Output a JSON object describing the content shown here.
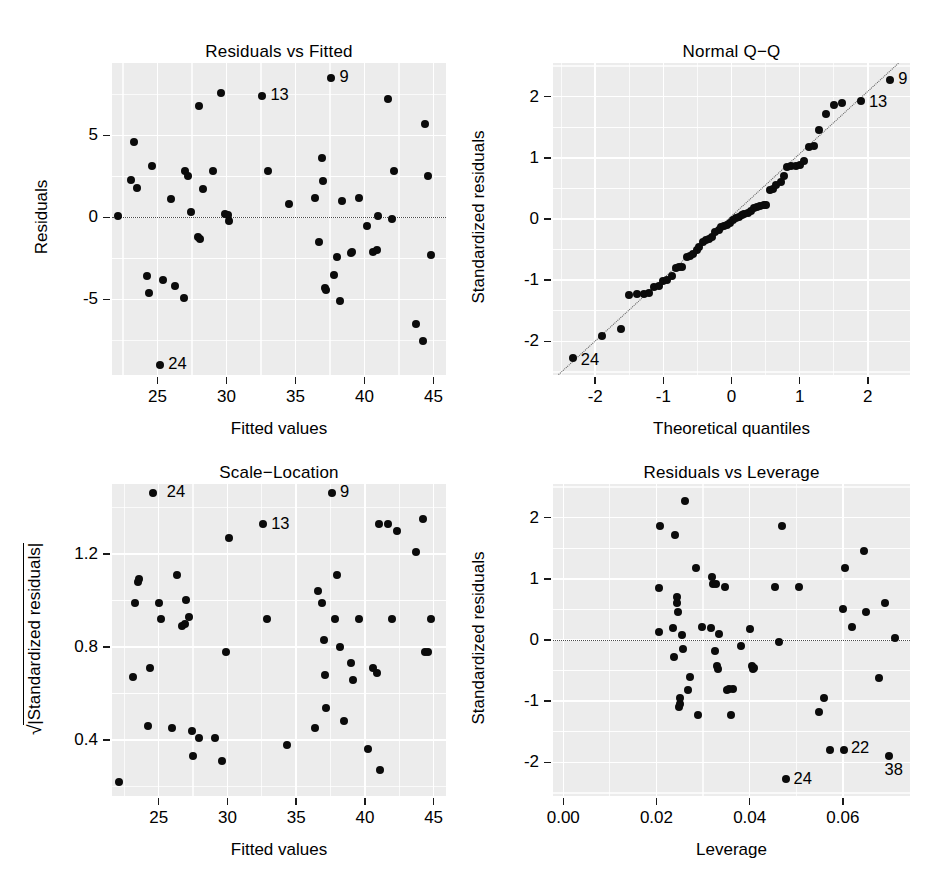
{
  "figure": {
    "kind": "r-regression-diagnostic-plots",
    "background": "#ffffff",
    "panel_background": "#ececec",
    "grid_color": "#ffffff",
    "point_color": "#0b0b0b"
  },
  "chart_data": [
    {
      "id": "residuals-vs-fitted",
      "type": "scatter",
      "title": "Residuals vs Fitted",
      "xlabel": "Fitted values",
      "ylabel": "Residuals",
      "xticks": [
        25,
        30,
        35,
        40,
        45
      ],
      "xticklabels": [
        "25",
        "30",
        "35",
        "40",
        "45"
      ],
      "yticks": [
        5,
        0,
        -5
      ],
      "yticklabels": [
        "5",
        "0",
        "-5"
      ],
      "xlim": [
        21.7,
        45.9
      ],
      "ylim": [
        -9.6,
        9.4
      ],
      "grid": true,
      "reference_line": {
        "type": "horizontal-dotted",
        "y": 0
      },
      "x": [
        22.1,
        23.1,
        23.3,
        23.5,
        24.2,
        24.4,
        24.6,
        25.2,
        25.4,
        26.0,
        26.3,
        26.9,
        27.0,
        27.2,
        27.4,
        27.9,
        28.0,
        28.1,
        28.3,
        29.0,
        29.6,
        29.9,
        30.1,
        30.2,
        32.6,
        33.0,
        34.5,
        36.4,
        36.7,
        36.9,
        37.0,
        37.1,
        37.2,
        37.6,
        37.8,
        38.0,
        38.2,
        38.4,
        39.0,
        39.1,
        39.6,
        40.2,
        40.6,
        40.9,
        41.0,
        41.7,
        42.0,
        42.1,
        43.7,
        44.2,
        44.4,
        44.6,
        44.8
      ],
      "y": [
        0.1,
        2.3,
        4.6,
        1.8,
        -3.6,
        -4.6,
        3.1,
        -9.0,
        -3.8,
        1.1,
        -4.2,
        -4.9,
        2.8,
        2.5,
        0.3,
        -1.2,
        6.8,
        -1.3,
        1.7,
        2.8,
        7.6,
        0.2,
        0.15,
        -0.2,
        7.4,
        2.8,
        0.8,
        1.2,
        -1.5,
        3.6,
        2.2,
        -4.3,
        -4.4,
        8.5,
        -3.5,
        -2.4,
        -5.1,
        1.0,
        -2.2,
        -2.1,
        1.2,
        -0.5,
        -2.1,
        -2.0,
        0.1,
        7.2,
        -0.1,
        2.8,
        -6.5,
        -7.5,
        5.7,
        2.5,
        -2.3
      ],
      "labeled_points": [
        {
          "label": "9",
          "x": 37.6,
          "y": 8.5,
          "dx": 8,
          "dy": -1
        },
        {
          "label": "13",
          "x": 32.6,
          "y": 7.4,
          "dx": 8,
          "dy": -1
        },
        {
          "label": "24",
          "x": 25.2,
          "y": -9.0,
          "dx": 8,
          "dy": -1
        }
      ]
    },
    {
      "id": "normal-qq",
      "type": "scatter",
      "title": "Normal Q−Q",
      "xlabel": "Theoretical quantiles",
      "ylabel": "Standardized residuals",
      "xticks": [
        -2,
        -1,
        0,
        1,
        2
      ],
      "xticklabels": [
        "-2",
        "-1",
        "0",
        "1",
        "2"
      ],
      "yticks": [
        2,
        1,
        0,
        -1,
        -2
      ],
      "yticklabels": [
        "2",
        "1",
        "0",
        "-1",
        "-2"
      ],
      "xlim": [
        -2.62,
        2.62
      ],
      "ylim": [
        -2.55,
        2.55
      ],
      "grid": true,
      "reference_line": {
        "type": "qq-diagonal-dotted",
        "slope": 1.02,
        "intercept": 0.06
      },
      "x": [
        -2.33,
        -1.9,
        -1.62,
        -1.5,
        -1.38,
        -1.29,
        -1.21,
        -1.14,
        -1.07,
        -1.0,
        -0.94,
        -0.88,
        -0.82,
        -0.77,
        -0.72,
        -0.66,
        -0.61,
        -0.56,
        -0.51,
        -0.47,
        -0.42,
        -0.37,
        -0.33,
        -0.28,
        -0.24,
        -0.19,
        -0.15,
        -0.11,
        -0.06,
        -0.02,
        0.02,
        0.06,
        0.11,
        0.15,
        0.19,
        0.24,
        0.28,
        0.33,
        0.37,
        0.42,
        0.47,
        0.51,
        0.56,
        0.61,
        0.66,
        0.72,
        0.77,
        0.82,
        0.88,
        0.94,
        1.0,
        1.07,
        1.14,
        1.21,
        1.29,
        1.38,
        1.5,
        1.62,
        1.9,
        2.33
      ],
      "y": [
        -2.28,
        -1.92,
        -1.8,
        -1.25,
        -1.22,
        -1.22,
        -1.21,
        -1.11,
        -1.09,
        -1.02,
        -1.0,
        -0.93,
        -0.8,
        -0.79,
        -0.79,
        -0.62,
        -0.6,
        -0.57,
        -0.5,
        -0.46,
        -0.38,
        -0.34,
        -0.33,
        -0.29,
        -0.21,
        -0.18,
        -0.13,
        -0.12,
        -0.1,
        -0.06,
        -0.02,
        0.01,
        0.03,
        0.06,
        0.08,
        0.1,
        0.13,
        0.18,
        0.2,
        0.22,
        0.23,
        0.23,
        0.47,
        0.49,
        0.55,
        0.6,
        0.7,
        0.85,
        0.86,
        0.86,
        0.88,
        0.95,
        1.18,
        1.2,
        1.45,
        1.72,
        1.87,
        1.9,
        1.93,
        2.28
      ],
      "labeled_points": [
        {
          "label": "9",
          "x": 2.33,
          "y": 2.28,
          "dx": 8,
          "dy": -1
        },
        {
          "label": "13",
          "x": 1.9,
          "y": 1.93,
          "dx": 8,
          "dy": 1
        },
        {
          "label": "24",
          "x": -2.33,
          "y": -2.28,
          "dx": 8,
          "dy": 2
        }
      ]
    },
    {
      "id": "scale-location",
      "type": "scatter",
      "title": "Scale−Location",
      "xlabel": "Fitted values",
      "ylabel": "√|Standardized residuals|",
      "xticks": [
        25,
        30,
        35,
        40,
        45
      ],
      "xticklabels": [
        "25",
        "30",
        "35",
        "40",
        "45"
      ],
      "yticks": [
        1.2,
        0.8,
        0.4
      ],
      "yticklabels": [
        "1.2",
        "0.8",
        "0.4"
      ],
      "xlim": [
        21.6,
        45.9
      ],
      "ylim": [
        0.16,
        1.5
      ],
      "grid": true,
      "x": [
        22.1,
        23.1,
        23.3,
        23.5,
        23.6,
        24.2,
        24.4,
        24.6,
        25.0,
        25.2,
        26.0,
        26.3,
        26.7,
        26.9,
        27.0,
        27.2,
        27.4,
        27.5,
        27.9,
        29.1,
        29.6,
        29.9,
        30.1,
        32.6,
        32.9,
        34.3,
        36.4,
        36.6,
        36.9,
        37.0,
        37.1,
        37.2,
        37.6,
        37.8,
        38.0,
        38.2,
        38.5,
        39.0,
        39.1,
        39.6,
        40.2,
        40.6,
        40.9,
        41.0,
        41.1,
        41.7,
        42.0,
        42.3,
        43.7,
        44.2,
        44.4,
        44.6,
        44.8
      ],
      "y": [
        0.22,
        0.67,
        0.99,
        1.08,
        1.09,
        0.46,
        0.71,
        1.46,
        0.99,
        0.92,
        0.45,
        1.11,
        0.89,
        0.9,
        1.0,
        0.93,
        0.44,
        0.33,
        0.41,
        0.41,
        0.31,
        0.78,
        1.27,
        1.33,
        0.92,
        0.38,
        0.45,
        1.04,
        0.99,
        0.83,
        0.68,
        0.54,
        1.46,
        0.92,
        1.11,
        0.8,
        0.48,
        0.73,
        0.66,
        0.92,
        0.36,
        0.71,
        0.69,
        1.33,
        0.27,
        1.33,
        0.92,
        1.3,
        1.21,
        1.35,
        0.78,
        0.78,
        0.92
      ],
      "labeled_points": [
        {
          "label": "24",
          "x": 25.0,
          "y": 1.46,
          "dx": 8,
          "dy": -1
        },
        {
          "label": "9",
          "x": 37.6,
          "y": 1.46,
          "dx": 8,
          "dy": -1
        },
        {
          "label": "13",
          "x": 32.6,
          "y": 1.33,
          "dx": 8,
          "dy": 0
        }
      ]
    },
    {
      "id": "residuals-vs-leverage",
      "type": "scatter",
      "title": "Residuals vs Leverage",
      "xlabel": "Leverage",
      "ylabel": "Standardized residuals",
      "xticks": [
        0.0,
        0.02,
        0.04,
        0.06
      ],
      "xticklabels": [
        "0.00",
        "0.02",
        "0.04",
        "0.06"
      ],
      "yticks": [
        2,
        1,
        0,
        -1,
        -2
      ],
      "yticklabels": [
        "2",
        "1",
        "0",
        "-1",
        "-2"
      ],
      "xlim": [
        -0.0022,
        0.0744
      ],
      "ylim": [
        -2.55,
        2.55
      ],
      "grid": true,
      "reference_line": {
        "type": "horizontal-dotted",
        "y": 0
      },
      "x": [
        0.0205,
        0.0206,
        0.0208,
        0.0235,
        0.0238,
        0.024,
        0.0243,
        0.0245,
        0.0246,
        0.0248,
        0.025,
        0.0251,
        0.0254,
        0.0256,
        0.0262,
        0.0268,
        0.0271,
        0.0285,
        0.029,
        0.0297,
        0.0316,
        0.032,
        0.0322,
        0.0325,
        0.0327,
        0.0329,
        0.0331,
        0.0334,
        0.0348,
        0.0352,
        0.0355,
        0.036,
        0.0365,
        0.0382,
        0.0401,
        0.0404,
        0.0407,
        0.041,
        0.0455,
        0.0462,
        0.047,
        0.0477,
        0.0505,
        0.0548,
        0.056,
        0.0572,
        0.06,
        0.0602,
        0.0604,
        0.062,
        0.0645,
        0.065,
        0.0678,
        0.069,
        0.07,
        0.0712
      ],
      "y": [
        0.13,
        0.85,
        1.87,
        0.19,
        -0.28,
        1.72,
        0.7,
        0.6,
        0.45,
        -1.1,
        -1.05,
        -0.95,
        0.08,
        -0.15,
        2.28,
        -0.82,
        -0.6,
        1.18,
        -1.22,
        0.22,
        0.2,
        1.03,
        0.91,
        -0.18,
        0.92,
        -0.42,
        -0.48,
        0.1,
        0.86,
        -0.82,
        -0.8,
        -1.23,
        -0.8,
        -0.1,
        0.18,
        -0.42,
        -0.48,
        -0.45,
        0.86,
        -0.03,
        1.87,
        -2.28,
        0.86,
        -1.18,
        -0.95,
        -1.8,
        0.5,
        -1.8,
        1.18,
        0.22,
        1.45,
        0.45,
        -0.62,
        0.6,
        -1.9,
        0.04
      ],
      "labeled_points": [
        {
          "label": "22",
          "x": 0.06,
          "y": -1.8,
          "dx": 8,
          "dy": -2
        },
        {
          "label": "38",
          "x": 0.07,
          "y": -1.9,
          "dx": -5,
          "dy": 14
        },
        {
          "label": "24",
          "x": 0.0477,
          "y": -2.28,
          "dx": 8,
          "dy": 0
        }
      ]
    }
  ]
}
